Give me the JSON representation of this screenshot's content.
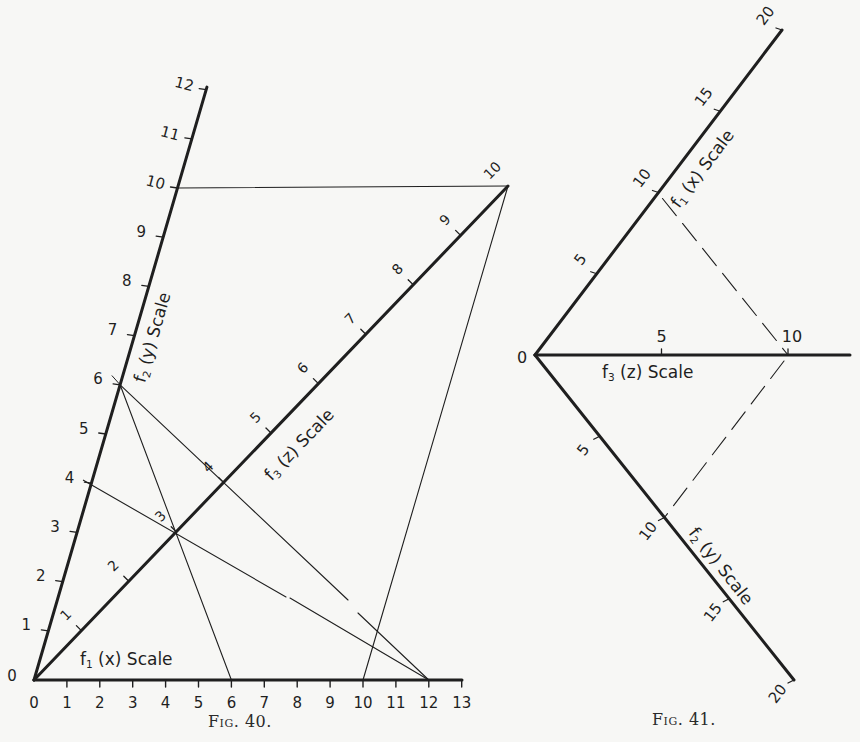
{
  "figures": [
    {
      "caption": "Fig. 40.",
      "origin_label": "0",
      "axes": {
        "f1": {
          "label_main": "f",
          "label_sub": "1",
          "label_rest": "(x) Scale",
          "ticks": [
            "0",
            "1",
            "2",
            "3",
            "4",
            "5",
            "6",
            "7",
            "8",
            "9",
            "10",
            "11",
            "12",
            "13"
          ]
        },
        "f2": {
          "label_main": "f",
          "label_sub": "2",
          "label_rest": "(y) Scale",
          "ticks": [
            "1",
            "2",
            "3",
            "4",
            "5",
            "6",
            "7",
            "8",
            "9",
            "10",
            "11",
            "12"
          ]
        },
        "f3": {
          "label_main": "f",
          "label_sub": "3",
          "label_rest": "(z) Scale",
          "ticks": [
            "1",
            "2",
            "3",
            "4",
            "5",
            "6",
            "7",
            "8",
            "9",
            "10"
          ]
        }
      },
      "construction_lines": [
        {
          "from": "f2=10",
          "to": "f3=10",
          "style": "solid"
        },
        {
          "from": "f3=10",
          "to": "f1=10",
          "style": "solid"
        },
        {
          "from": "f2=6",
          "to": "f1=6",
          "style": "solid"
        },
        {
          "from": "f2=6",
          "to": "f1=12",
          "style": "solid"
        },
        {
          "from": "f2=4",
          "to": "f1=12",
          "style": "solid"
        }
      ]
    },
    {
      "caption": "Fig. 41.",
      "origin_label": "0",
      "axes": {
        "f1": {
          "label_main": "f",
          "label_sub": "1",
          "label_rest": "(x) Scale",
          "ticks": [
            "5",
            "10",
            "15",
            "20"
          ]
        },
        "f2": {
          "label_main": "f",
          "label_sub": "2",
          "label_rest": "(y) Scale",
          "ticks": [
            "5",
            "10",
            "15",
            "20"
          ]
        },
        "f3": {
          "label_main": "f",
          "label_sub": "3",
          "label_rest": "(z) Scale",
          "ticks": [
            "5",
            "10"
          ]
        }
      },
      "construction_lines": [
        {
          "from": "f1=10",
          "to": "f3=10",
          "style": "dashed"
        },
        {
          "from": "f3=10",
          "to": "f2=10",
          "style": "dashed"
        }
      ]
    }
  ],
  "colors": {
    "ink": "#1f1f1f",
    "paper": "#f7f7f5"
  }
}
